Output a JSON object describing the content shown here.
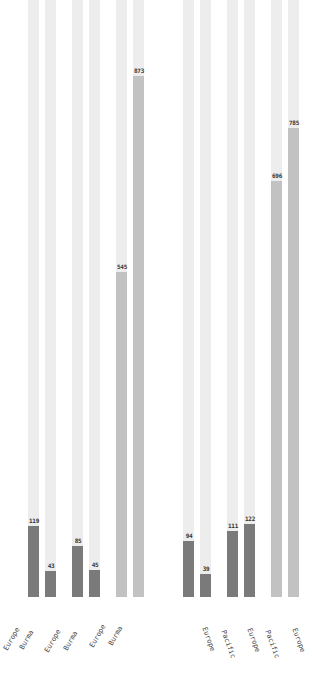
{
  "chart_data": {
    "type": "bar",
    "title": "",
    "xlabel": "",
    "ylabel": "",
    "ylim": [
      0,
      1000
    ],
    "grid": false,
    "legend": null,
    "orientation": "vertical",
    "panels": [
      {
        "name": "left",
        "categories": [
          "Europe",
          "Burma",
          "Europe",
          "Burma",
          "Europe",
          "Burma"
        ],
        "values": [
          119,
          43,
          85,
          45,
          545,
          873
        ],
        "colors": [
          "#7a7a7a",
          "#7a7a7a",
          "#7a7a7a",
          "#7a7a7a",
          "#c2c2c2",
          "#c2c2c2"
        ]
      },
      {
        "name": "right",
        "categories": [
          "Europe",
          "Pacific",
          "Europe",
          "Pacific",
          "Europe"
        ],
        "values": [
          94,
          39,
          111,
          122,
          696,
          785
        ],
        "colors": [
          "#7a7a7a",
          "#7a7a7a",
          "#7a7a7a",
          "#7a7a7a",
          "#c2c2c2",
          "#c2c2c2"
        ]
      }
    ]
  },
  "colors": {
    "track": "#ededed",
    "dark_bar": "#7a7a7a",
    "light_bar": "#c2c2c2",
    "label": "#333333"
  },
  "bars": [
    {
      "label": "119",
      "value": 119,
      "x": 28,
      "color": "#7a7a7a"
    },
    {
      "label": "43",
      "value": 43,
      "x": 45,
      "color": "#7a7a7a"
    },
    {
      "label": "85",
      "value": 85,
      "x": 72,
      "color": "#7a7a7a"
    },
    {
      "label": "45",
      "value": 45,
      "x": 89,
      "color": "#7a7a7a"
    },
    {
      "label": "545",
      "value": 545,
      "x": 116,
      "color": "#c2c2c2"
    },
    {
      "label": "873",
      "value": 873,
      "x": 133,
      "color": "#c2c2c2"
    },
    {
      "label": "94",
      "value": 94,
      "x": 183,
      "color": "#7a7a7a"
    },
    {
      "label": "39",
      "value": 39,
      "x": 200,
      "color": "#7a7a7a"
    },
    {
      "label": "111",
      "value": 111,
      "x": 227,
      "color": "#7a7a7a"
    },
    {
      "label": "122",
      "value": 122,
      "x": 244,
      "color": "#7a7a7a"
    },
    {
      "label": "696",
      "value": 696,
      "x": 271,
      "color": "#c2c2c2"
    },
    {
      "label": "785",
      "value": 785,
      "x": 288,
      "color": "#c2c2c2"
    }
  ],
  "xlabels_left": [
    {
      "text": "Europe",
      "x": 2,
      "y": 648
    },
    {
      "text": "Burma",
      "x": 18,
      "y": 647
    },
    {
      "text": "Europe",
      "x": 43,
      "y": 650
    },
    {
      "text": "Burma",
      "x": 62,
      "y": 648
    },
    {
      "text": "Europe",
      "x": 88,
      "y": 645
    },
    {
      "text": "Burma",
      "x": 107,
      "y": 643
    }
  ],
  "xlabels_right": [
    {
      "text": "Europe",
      "x": 208,
      "y": 626
    },
    {
      "text": "Pacific",
      "x": 227,
      "y": 629
    },
    {
      "text": "Europe",
      "x": 253,
      "y": 627
    },
    {
      "text": "Pacific",
      "x": 271,
      "y": 629
    },
    {
      "text": "Europe",
      "x": 298,
      "y": 627
    }
  ]
}
